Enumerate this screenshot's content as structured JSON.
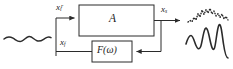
{
  "diagram": {
    "background_color": "#ffffff",
    "line_color": "#2b2b2b",
    "text_color": "#1a1a1a",
    "blocks": [
      {
        "id": "forward-gain",
        "label": "A",
        "x": 79,
        "y": 5,
        "width": 75,
        "height": 31
      },
      {
        "id": "feedback-filter",
        "label_base": "F(",
        "label_symbol": "ω",
        "label_close": ")",
        "label": "F(ω)",
        "x": 92,
        "y": 41,
        "width": 40,
        "height": 21
      }
    ],
    "signals": {
      "input_label_base": "x",
      "input_label_sub": "i",
      "input_label_sup": "r",
      "input_label": "xᵢʳ",
      "output_label_base": "x",
      "output_label_sub": "s",
      "output_label": "xₛ",
      "feedback_label_base": "x",
      "feedback_label_sub": "f",
      "feedback_label": "xꞢ"
    },
    "waveforms": {
      "input": {
        "name": "input-waveform",
        "style": "solid",
        "description": "smooth low-amplitude wavy line"
      },
      "output_noisy": {
        "name": "output-noisy-waveform",
        "style": "dotted",
        "description": "dotted jagged low-amplitude trace"
      },
      "output_signal": {
        "name": "output-signal-waveform",
        "style": "solid",
        "description": "solid large-amplitude jagged trace"
      }
    }
  }
}
